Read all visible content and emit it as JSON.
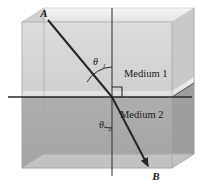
{
  "figure": {
    "type": "physics-optics-diagram",
    "labels": {
      "point_a": "A",
      "point_b": "B",
      "medium_1": "Medium 1",
      "medium_2": "Medium 2",
      "theta_1_symbol": "θ",
      "theta_1_subscript": "1",
      "theta_2_symbol": "θ",
      "theta_2_subscript": "2"
    },
    "colors": {
      "background": "#ffffff",
      "medium_1_front": "#d4d4d4",
      "medium_1_side": "#c6c6c6",
      "medium_2_front": "#a9a9a9",
      "medium_2_side": "#9d9d9d",
      "interface_band": "#e8e8e4",
      "floor": "#c0c0c0",
      "top_face": "#ececec",
      "ray": "#262626",
      "normal_line": "#3a3a3a",
      "edge_line": "#b0b0b0",
      "text": "#1a1a1a"
    },
    "geometry": {
      "box": {
        "front_left_x": 22,
        "front_right_x": 172,
        "front_top_y": 22,
        "front_bottom_y": 168,
        "depth_dx": 22,
        "depth_dy": -14
      },
      "interface_y": 97,
      "normal_x": 112,
      "normal_top_y": 8,
      "normal_bottom_y": 176,
      "incident_ray": {
        "x1": 48,
        "y1": 20,
        "x2": 112,
        "y2": 97
      },
      "refracted_ray": {
        "x1": 112,
        "y1": 97,
        "x2": 148,
        "y2": 166
      },
      "interface_line": {
        "x1": 8,
        "y1": 97,
        "x2": 192,
        "y2": 97
      },
      "right_angle_marker": {
        "x": 112,
        "y": 97,
        "size": 10
      }
    },
    "annotations": {
      "incident_angle_description": "Angle of incidence measured from the normal in Medium 1",
      "refracted_angle_description": "Angle of refraction measured from the normal in Medium 2",
      "right_angle_description": "Right angle between the normal and the interface plane"
    }
  }
}
